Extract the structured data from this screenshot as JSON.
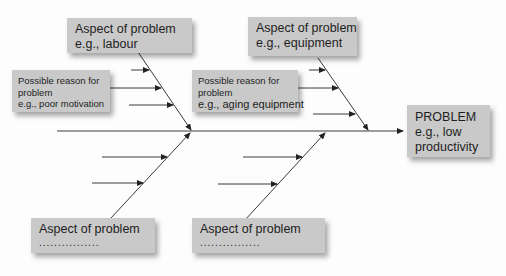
{
  "diagram": {
    "type": "fishbone",
    "colors": {
      "background": "#fdfdfd",
      "box_fill": "#c9c9c9",
      "line": "#333333"
    },
    "problem": {
      "title": "PROBLEM",
      "example_line1": "e.g., low",
      "example_line2": "productivity"
    },
    "aspects": {
      "top_left": {
        "title": "Aspect of problem",
        "example": "e.g., labour"
      },
      "top_right": {
        "title": "Aspect of problem",
        "example": "e.g., equipment"
      },
      "bottom_left": {
        "title": "Aspect of problem",
        "example": "................"
      },
      "bottom_right": {
        "title": "Aspect of problem",
        "example": "................"
      }
    },
    "reasons": {
      "left": {
        "line1": "Possible reason for",
        "line2": "problem",
        "example": "e.g., poor motivation"
      },
      "right": {
        "line1": "Possible reason for",
        "line2": "problem",
        "example": "e.g., aging equipment"
      }
    }
  }
}
